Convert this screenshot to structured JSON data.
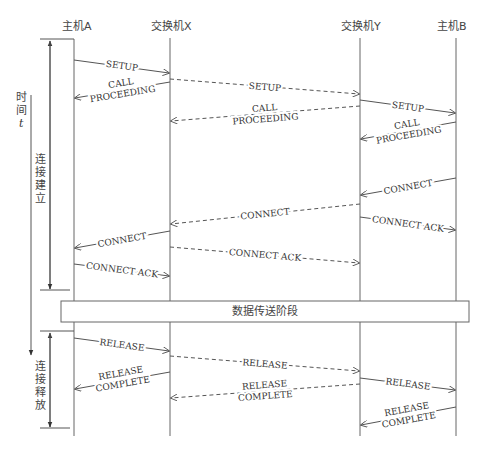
{
  "diagram": {
    "entities": [
      {
        "id": "hostA",
        "label": "主机A",
        "x": 74
      },
      {
        "id": "switchX",
        "label": "交换机X",
        "x": 170
      },
      {
        "id": "switchY",
        "label": "交换机Y",
        "x": 360
      },
      {
        "id": "hostB",
        "label": "主机B",
        "x": 456
      }
    ],
    "time_axis": {
      "label_line1": "时",
      "label_line2": "间",
      "label_line3": "t"
    },
    "phases": {
      "setup": {
        "line1": "连",
        "line2": "接",
        "line3": "建",
        "line4": "立"
      },
      "data_transfer": "数据传送阶段",
      "release": {
        "line1": "连",
        "line2": "接",
        "line3": "释",
        "line4": "放"
      }
    },
    "messages": [
      {
        "id": "m1",
        "from": "hostA",
        "to": "switchX",
        "label": "SETUP",
        "style": "solid"
      },
      {
        "id": "m2",
        "from": "switchX",
        "to": "hostA",
        "label1": "CALL",
        "label2": "PROCEEDING",
        "style": "solid"
      },
      {
        "id": "m3",
        "from": "switchX",
        "to": "switchY",
        "label": "SETUP",
        "style": "dashed"
      },
      {
        "id": "m4",
        "from": "switchY",
        "to": "switchX",
        "label1": "CALL",
        "label2": "PROCEEDING",
        "style": "dashed"
      },
      {
        "id": "m5",
        "from": "switchY",
        "to": "hostB",
        "label": "SETUP",
        "style": "solid"
      },
      {
        "id": "m6",
        "from": "hostB",
        "to": "switchY",
        "label1": "CALL",
        "label2": "PROCEEDING",
        "style": "solid"
      },
      {
        "id": "m7",
        "from": "hostB",
        "to": "switchY",
        "label": "CONNECT",
        "style": "solid"
      },
      {
        "id": "m8",
        "from": "switchY",
        "to": "switchX",
        "label": "CONNECT",
        "style": "dashed"
      },
      {
        "id": "m9",
        "from": "switchY",
        "to": "hostB",
        "label": "CONNECT ACK",
        "style": "solid"
      },
      {
        "id": "m10",
        "from": "switchX",
        "to": "hostA",
        "label": "CONNECT",
        "style": "solid"
      },
      {
        "id": "m11",
        "from": "switchX",
        "to": "switchY",
        "label": "CONNECT ACK",
        "style": "dashed"
      },
      {
        "id": "m12",
        "from": "hostA",
        "to": "switchX",
        "label": "CONNECT ACK",
        "style": "solid"
      },
      {
        "id": "m13",
        "from": "hostA",
        "to": "switchX",
        "label": "RELEASE",
        "style": "solid"
      },
      {
        "id": "m14",
        "from": "switchX",
        "to": "switchY",
        "label": "RELEASE",
        "style": "dashed"
      },
      {
        "id": "m15",
        "from": "switchX",
        "to": "hostA",
        "label1": "RELEASE",
        "label2": "COMPLETE",
        "style": "solid"
      },
      {
        "id": "m16",
        "from": "switchY",
        "to": "switchX",
        "label1": "RELEASE",
        "label2": "COMPLETE",
        "style": "dashed"
      },
      {
        "id": "m17",
        "from": "switchY",
        "to": "hostB",
        "label": "RELEASE",
        "style": "solid"
      },
      {
        "id": "m18",
        "from": "hostB",
        "to": "switchY",
        "label1": "RELEASE",
        "label2": "COMPLETE",
        "style": "solid"
      }
    ],
    "colors": {
      "line": "#555555",
      "text": "#333333",
      "background": "#ffffff"
    }
  }
}
